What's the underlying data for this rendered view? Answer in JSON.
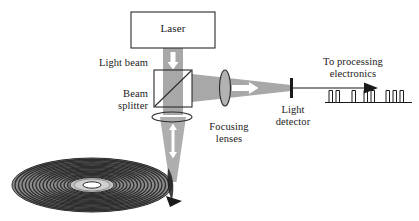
{
  "diagram": {
    "width": 419,
    "height": 221,
    "background_color": "#ffffff"
  },
  "labels": {
    "laser": "Laser",
    "light_beam": "Light beam",
    "beam_splitter_line1": "Beam",
    "beam_splitter_line2": "splitter",
    "beam_splitter": "Beam\nsplitter",
    "focusing_lenses_line1": "Focusing",
    "focusing_lenses_line2": "lenses",
    "focusing_lenses": "Focusing\nlenses",
    "light_detector_line1": "Light",
    "light_detector_line2": "detector",
    "light_detector": "Light\ndetector",
    "to_processing_line1": "To processing",
    "to_processing_line2": "electronics",
    "to_processing": "To processing\nelectronics"
  },
  "colors": {
    "beam_fill": "#a8a8a8",
    "beam_fill_light": "#b5b5b5",
    "arrow_white": "#ffffff",
    "outline": "#2b2b2b",
    "text": "#1a1a1a",
    "disc_dark": "#4a4a4a",
    "disc_track": "#2e2e2e",
    "disc_hub": "#bdbdbd",
    "disc_hole": "#ffffff",
    "signal_line": "#1a1a1a",
    "box_fill": "#ffffff"
  },
  "components": {
    "laser_box": {
      "x": 131,
      "y": 12,
      "width": 84,
      "height": 36,
      "label": "Laser"
    },
    "beam_splitter_cube": {
      "x": 154,
      "y": 70,
      "width": 38,
      "height": 37,
      "diagonal": "bottom-left-to-top-right"
    },
    "lower_lens": {
      "cx": 172,
      "cy": 117,
      "rx": 20,
      "ry": 5,
      "orientation": "horizontal"
    },
    "side_lens": {
      "cx": 225,
      "cy": 88,
      "rx": 5,
      "ry": 18,
      "orientation": "vertical"
    },
    "light_detector_bar": {
      "x": 291,
      "y": 78,
      "width": 3,
      "height": 20
    },
    "disc": {
      "cx": 92,
      "cy": 185,
      "rx": 80,
      "ry": 27,
      "track_count": 17,
      "hub_rx": 22,
      "hub_ry": 7,
      "hole_rx": 9,
      "hole_ry": 3
    }
  },
  "signal": {
    "description": "Digital pulse train output to processing electronics",
    "baseline_y": 102,
    "pulse_height": 12,
    "pulse_width": 3.5,
    "pulses_x": [
      329,
      335,
      349,
      360,
      366,
      380,
      386,
      392
    ],
    "groups": [
      2,
      1,
      2,
      3
    ],
    "arrow_from_x": 295,
    "arrow_to_x": 372,
    "arrow_y": 88
  },
  "beam_segments": [
    {
      "name": "laser-to-splitter",
      "direction": "down",
      "arrow": "single-down"
    },
    {
      "name": "splitter-to-disc",
      "direction": "down-converging",
      "arrow": "double-up-down"
    },
    {
      "name": "splitter-to-detector",
      "direction": "right-converging",
      "arrow": "single-right"
    }
  ]
}
